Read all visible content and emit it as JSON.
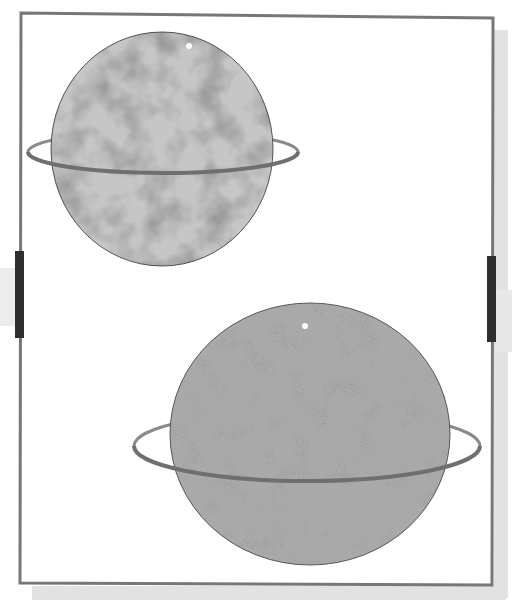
{
  "scene": {
    "description": "Framed illustration of two ringed planets",
    "colors": {
      "background": "#ffffff",
      "frame_stroke": "#777777",
      "shadow": "#e2e2e2",
      "handle": "#2e2e2e",
      "planet_top_fill": "#c6c6c6",
      "planet_bottom_fill": "#a9a9a9",
      "planet_outline": "#555555",
      "ring_stroke": "#8a8a8a",
      "ring_front_stroke": "#6f6f6f",
      "highlight_dot": "#ffffff",
      "spot_color": "#8c8c8c"
    },
    "frame": {
      "x": 21,
      "y": 14,
      "width": 471,
      "height": 571
    },
    "handles": [
      {
        "side": "left",
        "x": 15,
        "y": 251,
        "width": 9,
        "height": 87
      },
      {
        "side": "right",
        "x": 487,
        "y": 256,
        "width": 9,
        "height": 86
      }
    ],
    "planets": [
      {
        "name": "top-planet",
        "cx": 162,
        "cy": 149,
        "rx": 111,
        "ry": 117,
        "ring": {
          "cx": 163,
          "cy": 152,
          "rx": 135,
          "ry": 21
        },
        "highlight": {
          "cx": 189,
          "cy": 46,
          "r": 3
        },
        "texture": "mottled"
      },
      {
        "name": "bottom-planet",
        "cx": 310,
        "cy": 434,
        "rx": 140,
        "ry": 131,
        "ring": {
          "cx": 307,
          "cy": 446,
          "rx": 173,
          "ry": 35
        },
        "highlight": {
          "cx": 305,
          "cy": 326,
          "r": 3
        },
        "texture": "speckled"
      }
    ]
  }
}
